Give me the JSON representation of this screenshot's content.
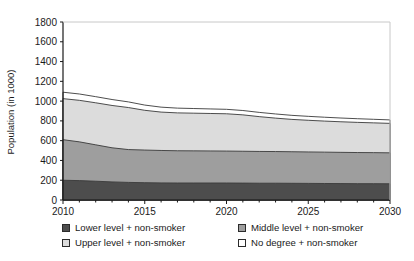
{
  "chart_data": {
    "type": "area",
    "stacked": true,
    "title": "",
    "xlabel": "",
    "ylabel": "Population (in 1000)",
    "xlim": [
      2010,
      2030
    ],
    "ylim": [
      0,
      1800
    ],
    "yticks": [
      0,
      200,
      400,
      600,
      800,
      1000,
      1200,
      1400,
      1600,
      1800
    ],
    "xticks": [
      2010,
      2015,
      2020,
      2025,
      2030
    ],
    "xtick_labels": [
      "2010",
      "2015",
      "2020",
      "2025",
      "2030"
    ],
    "ytick_labels": [
      "0",
      "200",
      "400",
      "600",
      "800",
      "1000",
      "1200",
      "1400",
      "1600",
      "1800"
    ],
    "x": [
      2010,
      2011,
      2012,
      2013,
      2014,
      2015,
      2016,
      2017,
      2018,
      2019,
      2020,
      2021,
      2022,
      2023,
      2024,
      2025,
      2026,
      2027,
      2028,
      2029,
      2030
    ],
    "grid": false,
    "legend_position": "below",
    "series": [
      {
        "name": "Lower level + non-smoker",
        "color": "#4d4d4d",
        "values": [
          200,
          196,
          190,
          183,
          178,
          175,
          173,
          172,
          172,
          172,
          172,
          171,
          170,
          170,
          169,
          168,
          167,
          166,
          165,
          165,
          164
        ]
      },
      {
        "name": "Middle level + non-smoker",
        "color": "#9e9e9e",
        "values": [
          410,
          392,
          368,
          345,
          332,
          330,
          328,
          326,
          325,
          324,
          323,
          322,
          321,
          320,
          319,
          318,
          317,
          316,
          315,
          314,
          313
        ]
      },
      {
        "name": "Upper level + non-smoker",
        "color": "#dcdcdc",
        "values": [
          415,
          420,
          425,
          428,
          425,
          402,
          388,
          383,
          381,
          379,
          377,
          368,
          352,
          338,
          327,
          320,
          314,
          309,
          305,
          301,
          298
        ]
      },
      {
        "name": "No degree + non-smoker",
        "color": "#ffffff",
        "values": [
          65,
          64,
          62,
          60,
          57,
          53,
          50,
          48,
          47,
          46,
          45,
          44,
          43,
          42,
          41,
          40,
          39,
          38,
          37,
          36,
          35
        ]
      }
    ],
    "cumulative_tops": {
      "lower": [
        200,
        196,
        190,
        183,
        178,
        175,
        173,
        172,
        172,
        172,
        172,
        171,
        170,
        170,
        169,
        168,
        167,
        166,
        165,
        165,
        164
      ],
      "middle": [
        610,
        588,
        558,
        528,
        510,
        505,
        501,
        498,
        497,
        496,
        495,
        493,
        491,
        490,
        488,
        486,
        484,
        482,
        480,
        479,
        477
      ],
      "upper": [
        1025,
        1008,
        983,
        956,
        935,
        907,
        889,
        881,
        878,
        875,
        872,
        861,
        843,
        828,
        815,
        806,
        798,
        791,
        785,
        780,
        775
      ],
      "total": [
        1090,
        1072,
        1045,
        1016,
        992,
        960,
        939,
        929,
        925,
        921,
        917,
        905,
        886,
        870,
        856,
        846,
        837,
        829,
        822,
        816,
        810
      ]
    }
  },
  "axis": {
    "ylabel": "Population (in 1000)"
  },
  "legend": {
    "items": [
      {
        "label": "Lower level + non-smoker",
        "swatch": "lower-swatch",
        "color": "#4d4d4d"
      },
      {
        "label": "Middle level + non-smoker",
        "swatch": "middle-swatch",
        "color": "#9e9e9e"
      },
      {
        "label": "Upper level + non-smoker",
        "swatch": "upper-swatch",
        "color": "#dcdcdc"
      },
      {
        "label": "No degree + non-smoker",
        "swatch": "no-degree-swatch",
        "color": "#ffffff"
      }
    ]
  }
}
